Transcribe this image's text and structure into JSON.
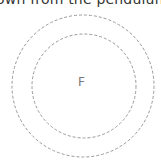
{
  "caption": "own from the pendulum",
  "diagram": {
    "center_label": "F",
    "circles": [
      {
        "name": "outer",
        "cx": 83,
        "cy": 86,
        "r": 71,
        "style": "dashed",
        "color": "#999999"
      },
      {
        "name": "inner",
        "cx": 84,
        "cy": 86,
        "r": 52,
        "style": "dashed",
        "color": "#999999"
      }
    ]
  }
}
